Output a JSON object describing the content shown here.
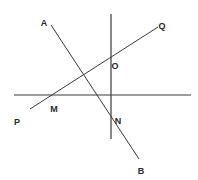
{
  "diagram": {
    "type": "geometry-lines",
    "stroke_color": "#3a3a3a",
    "background": "#ffffff",
    "lines": [
      {
        "id": "horizontal-line",
        "x1": 14,
        "y1": 95,
        "x2": 191,
        "y2": 95,
        "width": 1.2
      },
      {
        "id": "vertical-line",
        "x1": 111,
        "y1": 14,
        "x2": 111,
        "y2": 139,
        "width": 1.2
      },
      {
        "id": "line-AB",
        "x1": 51,
        "y1": 25,
        "x2": 139,
        "y2": 159,
        "width": 1
      },
      {
        "id": "line-PQ",
        "x1": 30,
        "y1": 109,
        "x2": 158,
        "y2": 27,
        "width": 1
      }
    ],
    "labels": [
      {
        "id": "label-A",
        "text": "A",
        "x": 44,
        "y": 23
      },
      {
        "id": "label-Q",
        "text": "Q",
        "x": 162,
        "y": 26
      },
      {
        "id": "label-O",
        "text": "O",
        "x": 115,
        "y": 66
      },
      {
        "id": "label-M",
        "text": "M",
        "x": 54,
        "y": 109
      },
      {
        "id": "label-P",
        "text": "P",
        "x": 17,
        "y": 122
      },
      {
        "id": "label-N",
        "text": "N",
        "x": 118,
        "y": 121
      },
      {
        "id": "label-B",
        "text": "B",
        "x": 141,
        "y": 171
      }
    ]
  }
}
